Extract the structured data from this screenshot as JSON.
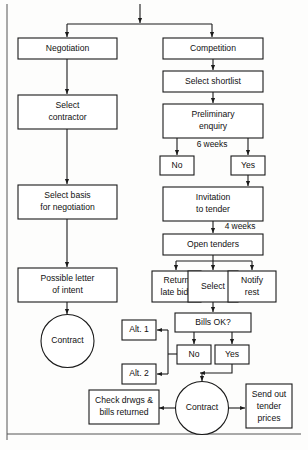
{
  "figure": {
    "kind": "flowchart",
    "background_color": "#fdfdfc",
    "line_color": "#1a1a1a",
    "text_color": "#111111",
    "frame_color": "#555555"
  },
  "nodes": {
    "negotiation": "Negotiation",
    "select_contractor_l1": "Select",
    "select_contractor_l2": "contractor",
    "select_basis_l1": "Select basis",
    "select_basis_l2": "for negotiation",
    "possible_letter_l1": "Possible letter",
    "possible_letter_l2": "of intent",
    "contract_left": "Contract",
    "competition": "Competition",
    "select_shortlist": "Select shortlist",
    "preliminary_l1": "Preliminary",
    "preliminary_l2": "enquiry",
    "no_prelim": "No",
    "yes_prelim": "Yes",
    "invitation_l1": "Invitation",
    "invitation_l2": "to tender",
    "open_tenders": "Open tenders",
    "return_late_l1": "Return",
    "return_late_l2": "late bids",
    "select_bid": "Select",
    "notify_rest_l1": "Notify",
    "notify_rest_l2": "rest",
    "bills_ok": "Bills OK?",
    "no_bills": "No",
    "yes_bills": "Yes",
    "alt_1": "Alt. 1",
    "alt_2": "Alt. 2",
    "contract_right": "Contract",
    "check_drwgs_l1": "Check drwgs &",
    "check_drwgs_l2": "bills returned",
    "send_out_l1": "Send out",
    "send_out_l2": "tender",
    "send_out_l3": "prices"
  },
  "edge_labels": {
    "six_weeks": "6 weeks",
    "four_weeks": "4 weeks"
  }
}
